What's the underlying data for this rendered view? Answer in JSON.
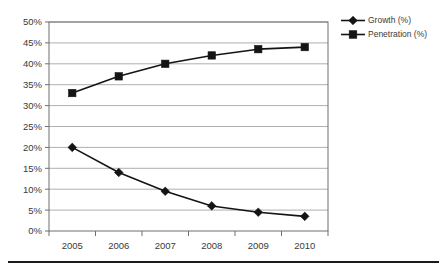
{
  "chart_data": {
    "type": "line",
    "title": "",
    "subtitle": "",
    "xlabel": "",
    "ylabel": "",
    "categories": [
      "2005",
      "2006",
      "2007",
      "2008",
      "2009",
      "2010"
    ],
    "x": [
      2005,
      2006,
      2007,
      2008,
      2009,
      2010
    ],
    "series": [
      {
        "name": "Growth (%)",
        "marker": "diamond",
        "color": "#141414",
        "values": [
          20.0,
          14.0,
          9.5,
          6.0,
          4.5,
          3.5
        ]
      },
      {
        "name": "Penetration (%)",
        "marker": "square",
        "color": "#141414",
        "values": [
          33.0,
          37.0,
          40.0,
          42.0,
          43.5,
          44.0
        ]
      }
    ],
    "ylim": [
      0,
      50
    ],
    "ytick_step": 5,
    "ytick_labels": [
      "0%",
      "5%",
      "10%",
      "15%",
      "20%",
      "25%",
      "30%",
      "35%",
      "40%",
      "45%",
      "50%"
    ],
    "ytick_values": [
      0,
      5,
      10,
      15,
      20,
      25,
      30,
      35,
      40,
      45,
      50
    ],
    "xtick_labels": [
      "2005",
      "2006",
      "2007",
      "2008",
      "2009",
      "2010"
    ],
    "grid": {
      "horizontal": true,
      "vertical": false,
      "color": "#9a9a9a"
    },
    "legend": {
      "position": "right",
      "entries": [
        {
          "label": "Growth (%)",
          "marker": "diamond"
        },
        {
          "label": "Penetration (%)",
          "marker": "square"
        }
      ]
    },
    "axis_color": "#6e6e6e",
    "background": "#ffffff"
  },
  "decorations": {
    "bottom_rule_present": true
  }
}
